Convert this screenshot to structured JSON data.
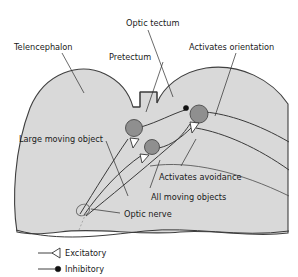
{
  "figure": {
    "background_color": "#ffffff",
    "tissue_fill_color": "#d9d9d9",
    "outline_color": "#404040",
    "soma_fill_color": "#8f8f8f",
    "text_color": "#1a1a1a"
  },
  "labels": {
    "telencephalon": "Telencephalon",
    "optic_tectum": "Optic tectum",
    "pretectum": "Pretectum",
    "activates_orientation": "Activates orientation",
    "large_moving_object": "Large moving object",
    "activates_avoidance": "Activates avoidance",
    "all_moving_objects": "All moving objects",
    "optic_nerve": "Optic nerve"
  },
  "legend": {
    "items": [
      {
        "key": "excitatory",
        "label": "Excitatory",
        "symbol": "open-triangle"
      },
      {
        "key": "inhibitory",
        "label": "Inhibitory",
        "symbol": "filled-circle"
      }
    ]
  },
  "structures": {
    "neurons": [
      {
        "name": "pretectal-neuron-upper",
        "cx": 134,
        "cy": 128
      },
      {
        "name": "pretectal-neuron-lower",
        "cx": 152,
        "cy": 147
      },
      {
        "name": "tectal-neuron",
        "cx": 199,
        "cy": 114
      }
    ],
    "synapses": [
      {
        "name": "excitatory-synapse-upper-left",
        "type": "excitatory"
      },
      {
        "name": "excitatory-synapse-lower-left",
        "type": "excitatory"
      },
      {
        "name": "excitatory-synapse-tectal",
        "type": "excitatory"
      },
      {
        "name": "inhibitory-synapse-tectal",
        "type": "inhibitory"
      }
    ]
  }
}
